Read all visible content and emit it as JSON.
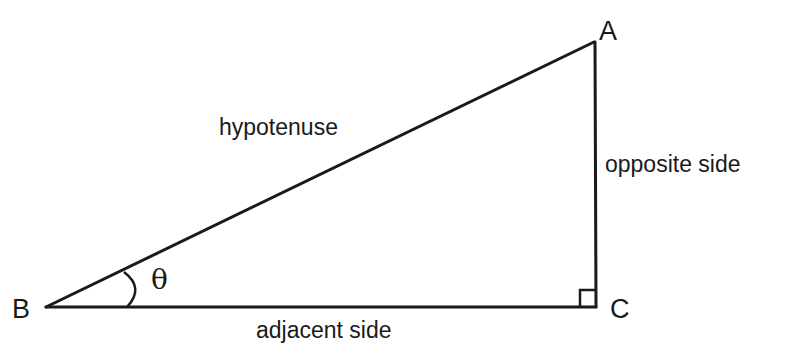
{
  "diagram": {
    "type": "right-triangle",
    "vertices": {
      "A": {
        "label": "A",
        "x": 594,
        "y": 42
      },
      "B": {
        "label": "B",
        "x": 46,
        "y": 307
      },
      "C": {
        "label": "C",
        "x": 596,
        "y": 307
      }
    },
    "sides": {
      "hypotenuse": {
        "label": "hypotenuse",
        "from": "B",
        "to": "A"
      },
      "opposite": {
        "label": "opposite side",
        "from": "C",
        "to": "A"
      },
      "adjacent": {
        "label": "adjacent side",
        "from": "B",
        "to": "C"
      }
    },
    "angle": {
      "symbol": "θ",
      "at": "B"
    },
    "right_angle_at": "C",
    "stroke_color": "#1a1a1a",
    "background": "#ffffff"
  }
}
